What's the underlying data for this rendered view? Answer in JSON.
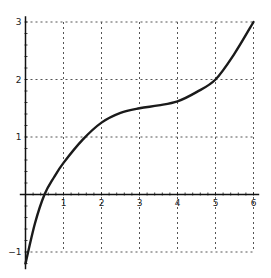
{
  "chart_data": {
    "type": "line",
    "title": "",
    "xlabel": "",
    "ylabel": "",
    "xlim": [
      -0.1,
      6.1
    ],
    "ylim": [
      -1.3,
      3.1
    ],
    "grid": true,
    "grid_style": "dotted",
    "x_ticks": [
      "1",
      "2",
      "3",
      "4",
      "5",
      "6"
    ],
    "y_ticks": [
      "-1",
      "1",
      "2",
      "3"
    ],
    "series": [
      {
        "name": "f(x)",
        "color": "#1a1a1a",
        "x": [
          0,
          0.25,
          0.5,
          0.75,
          1,
          1.5,
          2,
          2.5,
          3,
          3.5,
          4,
          4.5,
          5,
          5.5,
          6
        ],
        "values": [
          -1.2,
          -0.5,
          0.0,
          0.3,
          0.55,
          0.95,
          1.25,
          1.42,
          1.5,
          1.55,
          1.62,
          1.78,
          2.0,
          2.45,
          3.0
        ]
      }
    ]
  }
}
